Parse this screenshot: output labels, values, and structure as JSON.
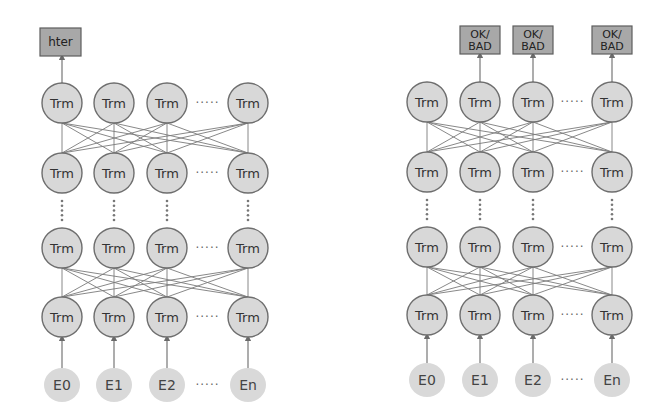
{
  "diagrams": [
    {
      "id": "left",
      "description": "sentence-level model",
      "columns_x": [
        62,
        114,
        167,
        248
      ],
      "rows_y": [
        103,
        173,
        248,
        317
      ],
      "embedding_y": 385,
      "node_label": "Trm",
      "embeddings": [
        "E0",
        "E1",
        "E2",
        "En"
      ],
      "ellipsis": "·····",
      "outputs": [
        {
          "label": "hter",
          "column": 0,
          "x": 40,
          "y": 28,
          "w": 41,
          "h": 28
        }
      ]
    },
    {
      "id": "right",
      "description": "word-level model",
      "columns_x": [
        427,
        480,
        533,
        612
      ],
      "rows_y": [
        102,
        172,
        247,
        315
      ],
      "embedding_y": 380,
      "node_label": "Trm",
      "embeddings": [
        "E0",
        "E1",
        "E2",
        "En"
      ],
      "ellipsis": "·····",
      "outputs": [
        {
          "label": "OK/",
          "label2": "BAD",
          "column": 1,
          "x": 460,
          "y": 26,
          "w": 40,
          "h": 28
        },
        {
          "label": "OK/",
          "label2": "BAD",
          "column": 2,
          "x": 513,
          "y": 26,
          "w": 40,
          "h": 28
        },
        {
          "label": "OK/",
          "label2": "BAD",
          "column": 3,
          "x": 592,
          "y": 26,
          "w": 40,
          "h": 28
        }
      ]
    }
  ],
  "colors": {
    "node_fill": "#d8d8d8",
    "node_stroke": "#6e6e6e",
    "embedding_fill": "#d9d9d9",
    "output_fill": "#a8a8a8",
    "line": "#7a7a7a"
  }
}
